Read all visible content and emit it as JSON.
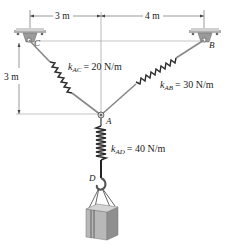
{
  "diagram": {
    "type": "spring-system-statics",
    "dimensions": {
      "horizontal_left": "3 m",
      "horizontal_right": "4 m",
      "vertical": "3 m"
    },
    "points": {
      "C": "C",
      "B": "B",
      "A": "A",
      "D": "D"
    },
    "springs": {
      "AC": {
        "symbol": "k",
        "sub": "AC",
        "value": "= 20 N/m"
      },
      "AB": {
        "symbol": "k",
        "sub": "AB",
        "value": "= 30 N/m"
      },
      "AD": {
        "symbol": "k",
        "sub": "AD",
        "value": "= 40 N/m"
      }
    },
    "colors": {
      "line": "#333333",
      "support": "#9a9a9a",
      "rod": "#888888",
      "spring": "#2a2a2a",
      "box_front": "#b8b8b8",
      "box_side": "#8f8f8f",
      "box_top": "#d4d4d4"
    }
  }
}
